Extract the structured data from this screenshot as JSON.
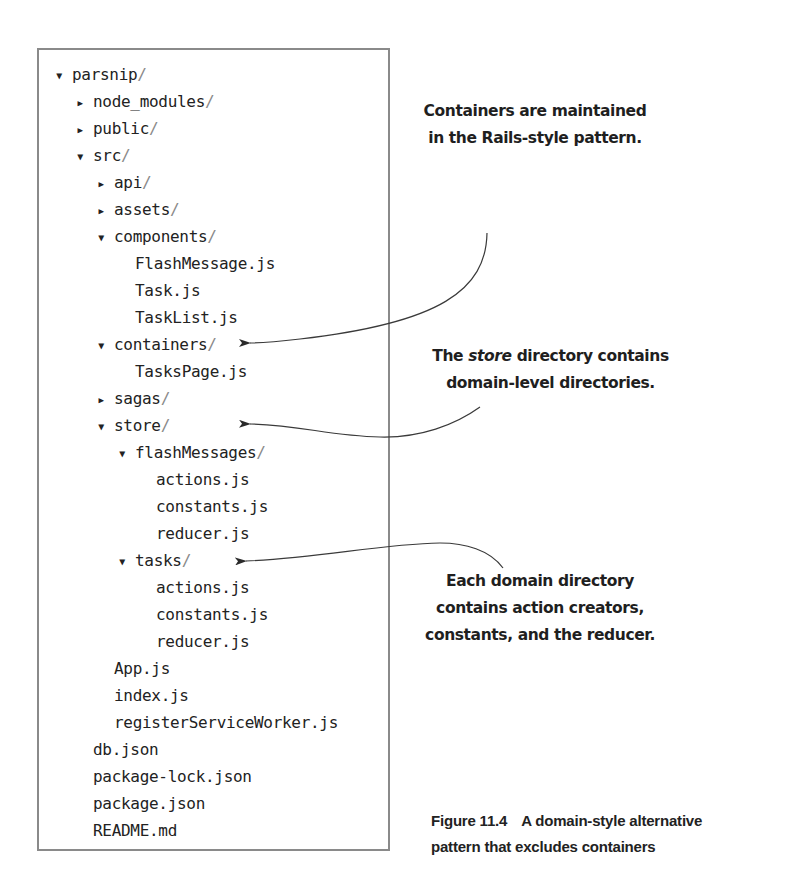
{
  "tree": {
    "rows": [
      {
        "name": "parsnip",
        "suffix": "/",
        "toggle": "expanded",
        "depth": 0,
        "top": 63
      },
      {
        "name": "node_modules",
        "suffix": "/",
        "toggle": "collapsed",
        "depth": 1,
        "top": 90
      },
      {
        "name": "public",
        "suffix": "/",
        "toggle": "collapsed",
        "depth": 1,
        "top": 117
      },
      {
        "name": "src",
        "suffix": "/",
        "toggle": "expanded",
        "depth": 1,
        "top": 144
      },
      {
        "name": "api",
        "suffix": "/",
        "toggle": "collapsed",
        "depth": 2,
        "top": 171
      },
      {
        "name": "assets",
        "suffix": "/",
        "toggle": "collapsed",
        "depth": 2,
        "top": 198
      },
      {
        "name": "components",
        "suffix": "/",
        "toggle": "expanded",
        "depth": 2,
        "top": 225
      },
      {
        "name": "FlashMessage.js",
        "suffix": "",
        "toggle": "none",
        "depth": 3,
        "top": 252
      },
      {
        "name": "Task.js",
        "suffix": "",
        "toggle": "none",
        "depth": 3,
        "top": 279
      },
      {
        "name": "TaskList.js",
        "suffix": "",
        "toggle": "none",
        "depth": 3,
        "top": 306
      },
      {
        "name": "containers",
        "suffix": "/",
        "toggle": "expanded",
        "depth": 2,
        "top": 333
      },
      {
        "name": "TasksPage.js",
        "suffix": "",
        "toggle": "none",
        "depth": 3,
        "top": 360
      },
      {
        "name": "sagas",
        "suffix": "/",
        "toggle": "collapsed",
        "depth": 2,
        "top": 387
      },
      {
        "name": "store",
        "suffix": "/",
        "toggle": "expanded",
        "depth": 2,
        "top": 414
      },
      {
        "name": "flashMessages",
        "suffix": "/",
        "toggle": "expanded",
        "depth": 3,
        "top": 441
      },
      {
        "name": "actions.js",
        "suffix": "",
        "toggle": "none",
        "depth": 4,
        "top": 468
      },
      {
        "name": "constants.js",
        "suffix": "",
        "toggle": "none",
        "depth": 4,
        "top": 495
      },
      {
        "name": "reducer.js",
        "suffix": "",
        "toggle": "none",
        "depth": 4,
        "top": 522
      },
      {
        "name": "tasks",
        "suffix": "/",
        "toggle": "expanded",
        "depth": 3,
        "top": 549
      },
      {
        "name": "actions.js",
        "suffix": "",
        "toggle": "none",
        "depth": 4,
        "top": 576
      },
      {
        "name": "constants.js",
        "suffix": "",
        "toggle": "none",
        "depth": 4,
        "top": 603
      },
      {
        "name": "reducer.js",
        "suffix": "",
        "toggle": "none",
        "depth": 4,
        "top": 630
      },
      {
        "name": "App.js",
        "suffix": "",
        "toggle": "none",
        "depth": 2,
        "top": 657
      },
      {
        "name": "index.js",
        "suffix": "",
        "toggle": "none",
        "depth": 2,
        "top": 684
      },
      {
        "name": "registerServiceWorker.js",
        "suffix": "",
        "toggle": "none",
        "depth": 2,
        "top": 711
      },
      {
        "name": "db.json",
        "suffix": "",
        "toggle": "none",
        "depth": 1,
        "top": 738
      },
      {
        "name": "package-lock.json",
        "suffix": "",
        "toggle": "none",
        "depth": 1,
        "top": 765
      },
      {
        "name": "package.json",
        "suffix": "",
        "toggle": "none",
        "depth": 1,
        "top": 792
      },
      {
        "name": "README.md",
        "suffix": "",
        "toggle": "none",
        "depth": 1,
        "top": 819
      }
    ]
  },
  "icons": {
    "expanded": "▼",
    "collapsed": "▶"
  },
  "callouts": {
    "containers": {
      "line1": "Containers are maintained",
      "line2": "in the Rails-style pattern."
    },
    "store": {
      "line1_pre": "The ",
      "line1_em": "store",
      "line1_post": " directory contains",
      "line2": "domain-level directories."
    },
    "domain": {
      "line1": "Each domain directory",
      "line2": "contains action creators,",
      "line3": "constants, and the reducer."
    }
  },
  "caption": {
    "figure_number": "Figure 11.4",
    "line1": "A domain-style alternative",
    "line2": "pattern that excludes containers"
  },
  "colors": {
    "border": "#8a8a8a",
    "text": "#222222",
    "arrow": "#3a3a3a"
  }
}
